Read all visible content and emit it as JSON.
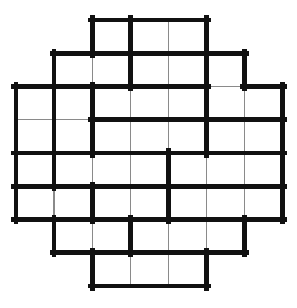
{
  "diagram": {
    "type": "grid-puzzle",
    "shape": "octagon",
    "background_color": "#ffffff",
    "thin_line_color": "#8a8a8a",
    "thick_line_color": "#111111",
    "thin_line_width": 1.4,
    "thick_line_width": 4.6,
    "geometry": {
      "columns": 7,
      "rows": 8,
      "origin_x": 16,
      "origin_y": 20,
      "cell_width": 38.1,
      "cell_height": 33.25
    },
    "row_spans": [
      {
        "row": 0,
        "start_col": 2,
        "end_col": 4,
        "cells": 3
      },
      {
        "row": 1,
        "start_col": 1,
        "end_col": 5,
        "cells": 5
      },
      {
        "row": 2,
        "start_col": 0,
        "end_col": 6,
        "cells": 7
      },
      {
        "row": 3,
        "start_col": 0,
        "end_col": 6,
        "cells": 7
      },
      {
        "row": 4,
        "start_col": 0,
        "end_col": 6,
        "cells": 7
      },
      {
        "row": 5,
        "start_col": 0,
        "end_col": 6,
        "cells": 7
      },
      {
        "row": 6,
        "start_col": 1,
        "end_col": 5,
        "cells": 5
      },
      {
        "row": 7,
        "start_col": 2,
        "end_col": 4,
        "cells": 3
      }
    ],
    "total_cells": 44,
    "cages": [
      {
        "id": "cage-1",
        "cells": [
          [
            0,
            2
          ]
        ]
      },
      {
        "id": "cage-2",
        "cells": [
          [
            0,
            3
          ],
          [
            0,
            4
          ]
        ]
      },
      {
        "id": "cage-3",
        "cells": [
          [
            1,
            1
          ],
          [
            1,
            2
          ]
        ]
      },
      {
        "id": "cage-4",
        "cells": [
          [
            1,
            3
          ],
          [
            1,
            4
          ]
        ]
      },
      {
        "id": "cage-5",
        "cells": [
          [
            1,
            5
          ],
          [
            2,
            5
          ],
          [
            2,
            6
          ]
        ]
      },
      {
        "id": "cage-6",
        "cells": [
          [
            2,
            0
          ],
          [
            3,
            0
          ]
        ]
      },
      {
        "id": "cage-7",
        "cells": [
          [
            2,
            1
          ],
          [
            3,
            1
          ]
        ]
      },
      {
        "id": "cage-8",
        "cells": [
          [
            2,
            2
          ],
          [
            2,
            3
          ],
          [
            2,
            4
          ]
        ]
      },
      {
        "id": "cage-9",
        "cells": [
          [
            3,
            2
          ],
          [
            3,
            3
          ],
          [
            3,
            4
          ]
        ]
      },
      {
        "id": "cage-10",
        "cells": [
          [
            3,
            5
          ],
          [
            3,
            6
          ]
        ]
      },
      {
        "id": "cage-11",
        "cells": [
          [
            4,
            0
          ]
        ]
      },
      {
        "id": "cage-12",
        "cells": [
          [
            4,
            1
          ],
          [
            4,
            2
          ],
          [
            4,
            3
          ]
        ]
      },
      {
        "id": "cage-13",
        "cells": [
          [
            4,
            4
          ],
          [
            4,
            5
          ],
          [
            4,
            6
          ]
        ]
      },
      {
        "id": "cage-14",
        "cells": [
          [
            5,
            0
          ],
          [
            5,
            1
          ]
        ]
      },
      {
        "id": "cage-15",
        "cells": [
          [
            5,
            2
          ],
          [
            5,
            3
          ]
        ]
      },
      {
        "id": "cage-16",
        "cells": [
          [
            5,
            4
          ],
          [
            5,
            5
          ],
          [
            5,
            6
          ]
        ]
      },
      {
        "id": "cage-17",
        "cells": [
          [
            6,
            1
          ],
          [
            6,
            2
          ]
        ]
      },
      {
        "id": "cage-18",
        "cells": [
          [
            6,
            3
          ],
          [
            6,
            4
          ],
          [
            6,
            5
          ]
        ]
      },
      {
        "id": "cage-19",
        "cells": [
          [
            7,
            2
          ],
          [
            7,
            3
          ],
          [
            7,
            4
          ]
        ]
      }
    ]
  }
}
